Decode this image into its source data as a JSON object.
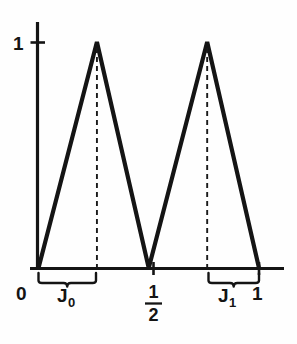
{
  "figure": {
    "title": "",
    "background_color": "#fefefe",
    "ink_color": "#141414"
  },
  "labels": {
    "y_one": "1",
    "x_zero": "0",
    "x_one": "1",
    "x_half_numerator": "1",
    "x_half_denominator": "2",
    "interval_0_base": "J",
    "interval_0_sub": "0",
    "interval_1_base": "J",
    "interval_1_sub": "1"
  },
  "chart_data": {
    "type": "line",
    "title": "",
    "xlabel": "",
    "ylabel": "",
    "xlim": [
      0,
      1.09
    ],
    "ylim": [
      0,
      1.12
    ],
    "grid": false,
    "legend": "none",
    "x_tick_labels": [
      "0",
      "1/2",
      "1"
    ],
    "x_tick_values": [
      0,
      0.5,
      1
    ],
    "y_tick_labels": [
      "1"
    ],
    "y_tick_values": [
      1
    ],
    "series": [
      {
        "name": "tent-function",
        "x": [
          0,
          0.265,
          0.5,
          0.765,
          1
        ],
        "values": [
          0,
          1,
          0,
          1,
          0
        ]
      }
    ],
    "annotations": [
      {
        "name": "peak-1-dashed-dropline",
        "type": "vertical-dashed",
        "x": 0.265,
        "y_from": 0,
        "y_to": 1
      },
      {
        "name": "peak-2-dashed-dropline",
        "type": "vertical-dashed",
        "x": 0.765,
        "y_from": 0,
        "y_to": 1
      },
      {
        "name": "interval-J0-brace",
        "type": "brace",
        "label": "J₀",
        "x_from": 0.0,
        "x_to": 0.265
      },
      {
        "name": "interval-J1-brace",
        "type": "brace",
        "label": "J₁",
        "x_from": 0.765,
        "x_to": 1.0
      }
    ]
  }
}
